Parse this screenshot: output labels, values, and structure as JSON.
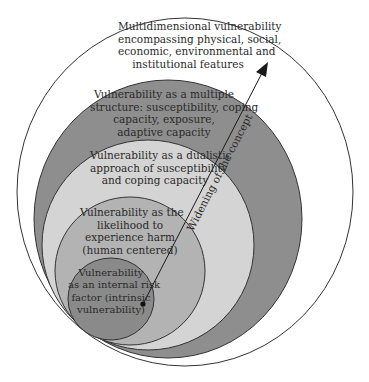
{
  "diagram": {
    "type": "nested-circles",
    "layers": [
      {
        "id": "multidimensional",
        "fill": "#ffffff",
        "lines": [
          "Multidimensional vulnerability",
          "encompassing physical, social,",
          "economic, environmental and",
          "institutional features"
        ]
      },
      {
        "id": "multiple-structure",
        "fill": "#8e8e8e",
        "lines": [
          "Vulnerability as a multiple",
          "structure: susceptibility, coping",
          "capacity, exposure,",
          "adaptive capacity"
        ]
      },
      {
        "id": "dualistic",
        "fill": "#d4d4d4",
        "lines": [
          "Vulnerability as a dualistic",
          "approach of susceptibility",
          "and coping capacity"
        ]
      },
      {
        "id": "likelihood",
        "fill": "#b3b3b3",
        "lines": [
          "Vulnerability as the",
          "likelihood to",
          "experience harm",
          "(human centered)"
        ]
      },
      {
        "id": "internal-risk",
        "fill": "#8a8a8a",
        "lines": [
          "Vulnerability",
          "as an internal risk",
          "factor (intrinsic",
          "vulnerability)"
        ]
      }
    ],
    "arrow": {
      "label": "Widening of the concept",
      "color": "#1a1a1a"
    },
    "stroke_color": "#2a2a2a"
  }
}
